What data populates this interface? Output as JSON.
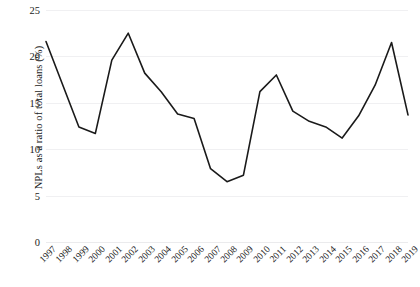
{
  "chart_data": {
    "type": "line",
    "title": "",
    "xlabel": "",
    "ylabel": "NPLs as a ratio of total loans (%)",
    "categories": [
      "1997",
      "1998",
      "1999",
      "2000",
      "2001",
      "2002",
      "2003",
      "2004",
      "2005",
      "2006",
      "2007",
      "2008",
      "2009",
      "2010",
      "2011",
      "2012",
      "2013",
      "2014",
      "2015",
      "2016",
      "2017",
      "2018",
      "2019"
    ],
    "values": [
      21.6,
      17.0,
      12.4,
      11.7,
      19.6,
      22.5,
      18.2,
      16.2,
      13.8,
      13.3,
      7.9,
      6.5,
      7.2,
      16.2,
      18.0,
      14.1,
      13.0,
      12.4,
      11.2,
      13.6,
      16.9,
      21.5,
      13.7
    ],
    "series": [
      {
        "name": "NPLs as a ratio of total loans (%)",
        "color": "#1a1a1a",
        "values": [
          21.6,
          17.0,
          12.4,
          11.7,
          19.6,
          22.5,
          18.2,
          16.2,
          13.8,
          13.3,
          7.9,
          6.5,
          7.2,
          16.2,
          18.0,
          14.1,
          13.0,
          12.4,
          11.2,
          13.6,
          16.9,
          21.5,
          13.7
        ]
      }
    ],
    "ylim": [
      0,
      25
    ],
    "yticks": [
      0,
      5,
      10,
      15,
      20,
      25
    ],
    "ytick_labels": [
      "0",
      "5",
      "10",
      "15",
      "20",
      "25"
    ],
    "grid": true,
    "grid_axis": "y",
    "grid_color": "#f0f0f2",
    "legend": false,
    "legend_position": "none",
    "line_width": 1.6,
    "markers": false,
    "background_color": "#ffffff",
    "text_color": "#1a1a1a"
  }
}
